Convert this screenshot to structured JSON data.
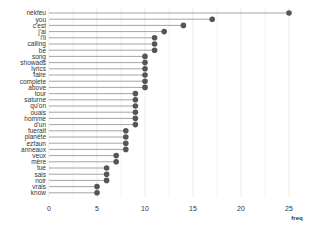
{
  "chart_data": {
    "type": "lollipop",
    "title": "",
    "xlabel": "freq",
    "ylabel": "",
    "xlim": [
      0,
      26
    ],
    "x_ticks": [
      0,
      5,
      10,
      15,
      20,
      25
    ],
    "grid": true,
    "legend": null,
    "categories": [
      "nekfeu",
      "you",
      "c'est",
      "j'ai",
      "i'll",
      "calling",
      "be",
      "song",
      "showads",
      "lyrics",
      "faire",
      "complete",
      "above",
      "tour",
      "saturne",
      "qu'on",
      "ouais",
      "homme",
      "d'un",
      "fuerait",
      "planète",
      "ezfaun",
      "anneaux",
      "veux",
      "mère",
      "tue",
      "sais",
      "noir",
      "vrais",
      "know"
    ],
    "values": [
      25,
      17,
      14,
      12,
      11,
      11,
      11,
      10,
      10,
      10,
      10,
      10,
      10,
      9,
      9,
      9,
      9,
      9,
      9,
      8,
      8,
      8,
      8,
      7,
      7,
      6,
      6,
      6,
      5,
      5
    ],
    "colors": {
      "dot": "#555555",
      "stem": "#9a9a9a",
      "grid": "#e6e6e6",
      "text": "#333333"
    }
  }
}
